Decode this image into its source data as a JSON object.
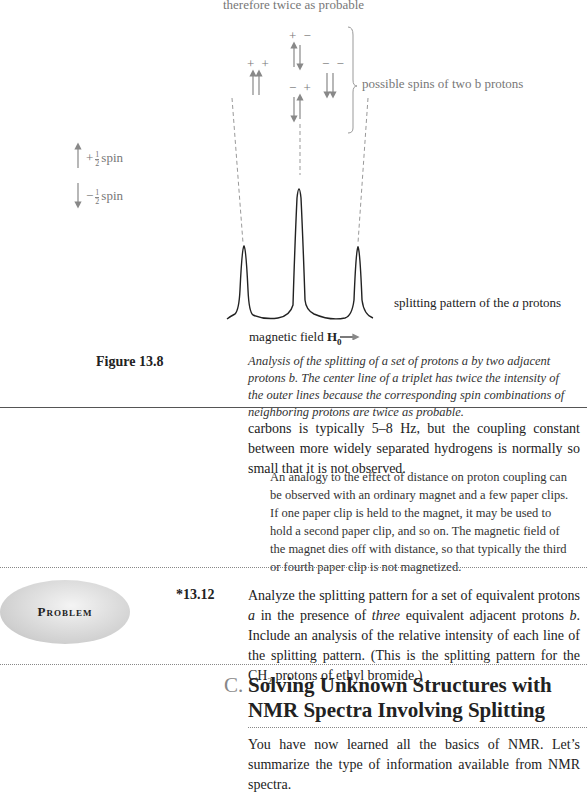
{
  "figure": {
    "top_caption": "therefore twice as probable",
    "spin_combinations": [
      {
        "label": "+ +",
        "arrows": [
          "up",
          "up"
        ]
      },
      {
        "label": "+ −",
        "arrows": [
          "up",
          "down"
        ]
      },
      {
        "label": "− +",
        "arrows": [
          "down",
          "up"
        ]
      },
      {
        "label": "− −",
        "arrows": [
          "down",
          "down"
        ]
      }
    ],
    "brace_label": "possible spins of two b protons",
    "legend": {
      "plus_sign": "+",
      "minus_sign": "−",
      "frac_num": "1",
      "frac_den": "2",
      "spin_word": "spin"
    },
    "pattern_label_pre": "splitting pattern of the ",
    "pattern_label_italic": "a",
    "pattern_label_post": " protons",
    "field_label": "magnetic field ",
    "field_symbol": "H",
    "field_sub": "0",
    "peaks": {
      "relative_intensities": [
        1,
        2,
        1
      ]
    }
  },
  "figure_caption": {
    "label": "Figure 13.8",
    "text": "Analysis of the splitting of a set of protons a by two adjacent protons b. The center line of a triplet has twice the intensity of the outer lines because the corresponding spin combinations of neighboring protons are twice as probable."
  },
  "body": {
    "para1": "carbons is typically 5–8 Hz, but the coupling constant between more widely separated hydrogens is normally so small that it is not observed.",
    "aside": "An analogy to the effect of distance on proton coupling can be observed with an ordinary magnet and a few paper clips. If one paper clip is held to the magnet, it may be used to hold a second paper clip, and so on. The magnetic field of the magnet dies off with distance, so that typically the third or fourth paper clip is not magnetized."
  },
  "problem": {
    "badge": "Problem",
    "number": "*13.12",
    "text_1": "Analyze the splitting pattern for a set of equivalent protons ",
    "text_a": "a",
    "text_2": " in the presence of ",
    "text_three": "three",
    "text_3": " equivalent adjacent protons ",
    "text_b": "b",
    "text_4": ". Include an analysis of the relative intensity of each line of the splitting pattern. (This is the splitting pattern for the CH",
    "text_sub": "2",
    "text_5": " protons of ethyl bromide.)"
  },
  "section": {
    "letter": "C.",
    "title_line1": "Solving Unknown Structures with",
    "title_line2": "NMR Spectra Involving Splitting",
    "para": "You have now learned all the basics of NMR. Let’s summarize the type of information available from NMR spectra."
  }
}
